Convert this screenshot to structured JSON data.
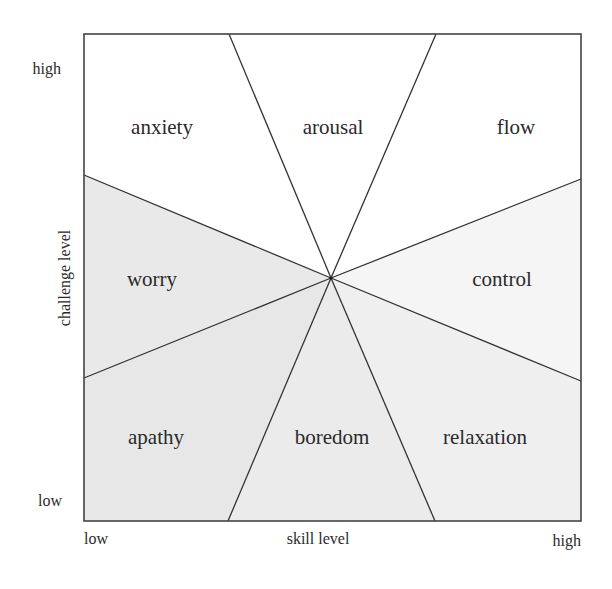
{
  "diagram": {
    "type": "flow-model-quadrant",
    "x_axis": {
      "label": "skill level",
      "low": "low",
      "high": "high"
    },
    "y_axis": {
      "label": "challenge level",
      "low": "low",
      "high": "high"
    },
    "regions": [
      {
        "id": "anxiety",
        "label": "anxiety",
        "shade": "#ffffff"
      },
      {
        "id": "arousal",
        "label": "arousal",
        "shade": "#ffffff"
      },
      {
        "id": "flow",
        "label": "flow",
        "shade": "#ffffff"
      },
      {
        "id": "control",
        "label": "control",
        "shade": "#f4f4f4"
      },
      {
        "id": "relaxation",
        "label": "relaxation",
        "shade": "#f0f0f0"
      },
      {
        "id": "boredom",
        "label": "boredom",
        "shade": "#ececec"
      },
      {
        "id": "apathy",
        "label": "apathy",
        "shade": "#e8e8e8"
      },
      {
        "id": "worry",
        "label": "worry",
        "shade": "#eaeaea"
      }
    ],
    "colors": {
      "line": "#333333",
      "text": "#2a2a2a",
      "background": "#ffffff"
    }
  }
}
